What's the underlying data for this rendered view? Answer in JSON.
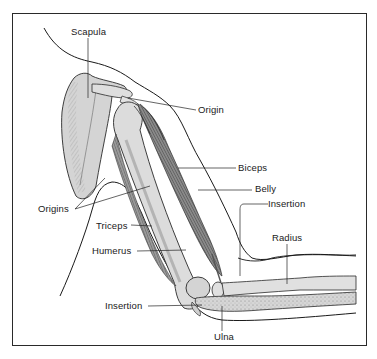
{
  "figure": {
    "type": "anatomical-diagram",
    "colors": {
      "border": "#2a2a2a",
      "bone_fill": "#d9d9d9",
      "bone_shade": "#a8a8a8",
      "muscle_fill": "#7a7a7a",
      "muscle_stroke": "#3a3a3a",
      "outline": "#1a1a1a",
      "leader_line": "#222222",
      "background": "#ffffff"
    }
  },
  "labels": {
    "scapula": "Scapula",
    "origin": "Origin",
    "biceps": "Biceps",
    "belly": "Belly",
    "insertion_biceps": "Insertion",
    "origins": "Origins",
    "triceps": "Triceps",
    "humerus": "Humerus",
    "radius": "Radius",
    "insertion_triceps": "Insertion",
    "ulna": "Ulna"
  }
}
